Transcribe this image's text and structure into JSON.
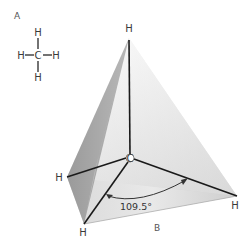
{
  "panels": {
    "a_label": "A",
    "b_label": "B"
  },
  "structural_formula": {
    "center": "C",
    "top": "H",
    "bottom": "H",
    "left": "H",
    "right": "H"
  },
  "tetrahedron": {
    "center_atom": "C",
    "apex_top": "H",
    "vertex_left": "H",
    "vertex_front": "H",
    "vertex_right": "H",
    "bond_angle": "109.5°"
  },
  "colors": {
    "face_dark": "#8f8f8f",
    "face_mid": "#bdbdbd",
    "face_light": "#e4e4e4",
    "bond": "#1a1a1a"
  }
}
